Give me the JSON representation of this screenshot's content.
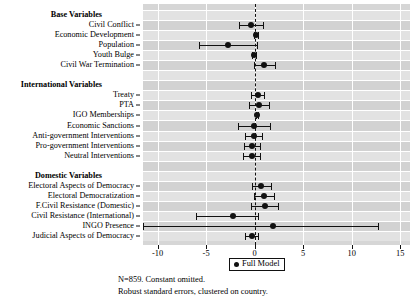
{
  "chart_data": {
    "type": "scatter",
    "title": "",
    "subtitle": "",
    "xlabel": "",
    "ylabel": "",
    "xlim": [
      -11.5,
      16.0
    ],
    "xticks": [
      -10,
      -5,
      0,
      5,
      10,
      15
    ],
    "xticklabels": [
      "-10",
      "-5",
      "0",
      "5",
      "10",
      "15"
    ],
    "grid": true,
    "zero_reference_line": 0,
    "legend": {
      "position": "bottom-center",
      "entries": [
        {
          "label": "Full Model",
          "marker": "filled-circle",
          "color": "#111111"
        }
      ]
    },
    "groups": [
      {
        "name": "Base Variables",
        "rows": [
          {
            "label": "Civil Conflict",
            "estimate": -0.35,
            "ci_low": -1.65,
            "ci_high": 0.85
          },
          {
            "label": "Economic Development",
            "estimate": 0.1,
            "ci_low": -0.1,
            "ci_high": 0.3
          },
          {
            "label": "Population",
            "estimate": -2.7,
            "ci_low": -5.7,
            "ci_high": 0.25
          },
          {
            "label": "Youth Bulge",
            "estimate": -0.05,
            "ci_low": -0.25,
            "ci_high": 0.15
          },
          {
            "label": "Civil War Termination",
            "estimate": 0.95,
            "ci_low": -0.1,
            "ci_high": 2.1
          }
        ]
      },
      {
        "name": "International Variables",
        "rows": [
          {
            "label": "Treaty",
            "estimate": 0.3,
            "ci_low": -0.35,
            "ci_high": 0.95
          },
          {
            "label": "PTA",
            "estimate": 0.45,
            "ci_low": -0.55,
            "ci_high": 1.45
          },
          {
            "label": "IGO Memberships",
            "estimate": 0.2,
            "ci_low": 0.1,
            "ci_high": 0.3
          },
          {
            "label": "Economic Sanctions",
            "estimate": -0.1,
            "ci_low": -1.75,
            "ci_high": 1.55
          },
          {
            "label": "Anti-government Interventions",
            "estimate": -0.1,
            "ci_low": -0.95,
            "ci_high": 0.8
          },
          {
            "label": "Pro-government Interventions",
            "estimate": -0.25,
            "ci_low": -1.1,
            "ci_high": 0.55
          },
          {
            "label": "Neutral Interventions",
            "estimate": -0.25,
            "ci_low": -1.15,
            "ci_high": 0.6
          }
        ]
      },
      {
        "name": "Domestic Variables",
        "rows": [
          {
            "label": "Electoral Aspects of Democracy",
            "estimate": 0.7,
            "ci_low": -0.25,
            "ci_high": 1.7
          },
          {
            "label": "Electoral Democratization",
            "estimate": 1.0,
            "ci_low": -0.1,
            "ci_high": 2.0
          },
          {
            "label": "F.Civil Resistance (Domestic)",
            "estimate": 1.05,
            "ci_low": -0.4,
            "ci_high": 2.45
          },
          {
            "label": "Civil Resistance (International)",
            "estimate": -2.25,
            "ci_low": -6.0,
            "ci_high": 0.3
          },
          {
            "label": "INGO Presence",
            "estimate": 1.85,
            "ci_low": -11.5,
            "ci_high": 12.75,
            "ci_low_clipped": true
          },
          {
            "label": "Judicial Aspects of Democracy",
            "estimate": -0.25,
            "ci_low": -0.95,
            "ci_high": 0.35
          }
        ]
      }
    ]
  },
  "footnote": {
    "line1": "N=859. Constant omitted.",
    "line2": "Robust standard errors, clustered on country."
  }
}
